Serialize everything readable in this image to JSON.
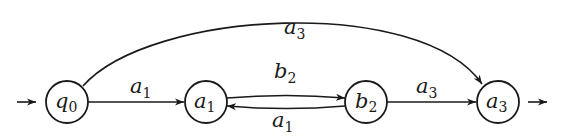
{
  "diagram": {
    "type": "finite-automaton",
    "states": [
      {
        "id": "q0",
        "base": "q",
        "sub": "0",
        "initial": true,
        "final": false
      },
      {
        "id": "a1",
        "base": "a",
        "sub": "1",
        "initial": false,
        "final": false
      },
      {
        "id": "b2",
        "base": "b",
        "sub": "2",
        "initial": false,
        "final": false
      },
      {
        "id": "a3",
        "base": "a",
        "sub": "3",
        "initial": false,
        "final": true
      }
    ],
    "transitions": [
      {
        "from": "q0",
        "to": "a1",
        "base": "a",
        "sub": "1"
      },
      {
        "from": "a1",
        "to": "b2",
        "base": "b",
        "sub": "2"
      },
      {
        "from": "b2",
        "to": "a1",
        "base": "a",
        "sub": "1"
      },
      {
        "from": "b2",
        "to": "a3",
        "base": "a",
        "sub": "3"
      },
      {
        "from": "q0",
        "to": "a3",
        "base": "a",
        "sub": "3"
      }
    ],
    "start_arrow": "→",
    "final_arrow": "→",
    "colors": {
      "stroke": "#1a1a1a",
      "background": "#ffffff"
    }
  }
}
